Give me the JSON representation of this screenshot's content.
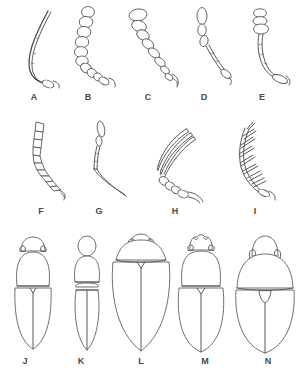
{
  "plate": {
    "title": "Beetle antenna types and body forms",
    "background_color": "#ffffff",
    "line_color": "#5a5a5a",
    "label_color": "#4a4a4a",
    "width": 301,
    "height": 374,
    "rows": [
      {
        "name": "antennae-row-1",
        "label_y": 97,
        "figure_count": 5
      },
      {
        "name": "antennae-row-2",
        "label_y": 211,
        "figure_count": 4
      },
      {
        "name": "body-forms-row",
        "label_y": 361,
        "figure_count": 5
      }
    ]
  },
  "figures": [
    {
      "id": "A",
      "label": "A",
      "label_x": 34,
      "label_y": 97,
      "kind": "antenna",
      "type": "filiform",
      "description": "slender thread-like antenna, uniform width, gently curved"
    },
    {
      "id": "B",
      "label": "B",
      "label_x": 88,
      "label_y": 97,
      "kind": "antenna",
      "type": "moniliform",
      "description": "bead-like rounded segments in a chain"
    },
    {
      "id": "C",
      "label": "C",
      "label_x": 148,
      "label_y": 97,
      "kind": "antenna",
      "type": "clavate",
      "description": "segments gradually enlarging toward the apex"
    },
    {
      "id": "D",
      "label": "D",
      "label_x": 204,
      "label_y": 97,
      "kind": "antenna",
      "type": "capitate",
      "description": "slender shaft with an abrupt narrow apical club"
    },
    {
      "id": "E",
      "label": "E",
      "label_x": 262,
      "label_y": 97,
      "kind": "antenna",
      "type": "clubbed",
      "description": "three enlarged terminal club segments"
    },
    {
      "id": "F",
      "label": "F",
      "label_x": 41,
      "label_y": 211,
      "kind": "antenna",
      "type": "serrate",
      "description": "saw-toothed, triangular segments projecting on one side"
    },
    {
      "id": "G",
      "label": "G",
      "label_x": 99,
      "label_y": 211,
      "kind": "antenna",
      "type": "geniculate",
      "description": "elbowed, long basal scape with angled flagellum"
    },
    {
      "id": "H",
      "label": "H",
      "label_x": 175,
      "label_y": 211,
      "kind": "antenna",
      "type": "lamellate",
      "description": "flattened plate-like lamellae at the apex"
    },
    {
      "id": "I",
      "label": "I",
      "label_x": 255,
      "label_y": 211,
      "kind": "antenna",
      "type": "pectinate",
      "description": "comb-like, with long slender branches from each segment"
    },
    {
      "id": "J",
      "label": "J",
      "label_x": 25,
      "label_y": 361,
      "kind": "body",
      "type": "elongate-parallel",
      "description": "elongate body, rounded head, trapezoidal pronotum, parallel-sided elytra"
    },
    {
      "id": "K",
      "label": "K",
      "label_x": 81,
      "label_y": 361,
      "kind": "body",
      "type": "narrow-constricted",
      "description": "very narrow constricted body, oval pronotum, slender elytra"
    },
    {
      "id": "L",
      "label": "L",
      "label_x": 141,
      "label_y": 361,
      "kind": "body",
      "type": "broad-oval",
      "description": "broad oval outline, head concealed beneath the pronotum"
    },
    {
      "id": "M",
      "label": "M",
      "label_x": 205,
      "label_y": 361,
      "kind": "body",
      "type": "oblong",
      "description": "oblong body with toothed clypeus on the head"
    },
    {
      "id": "N",
      "label": "N",
      "label_x": 268,
      "label_y": 361,
      "kind": "body",
      "type": "rounded-oval",
      "description": "broadly rounded convex oval, ladybird-like"
    }
  ]
}
